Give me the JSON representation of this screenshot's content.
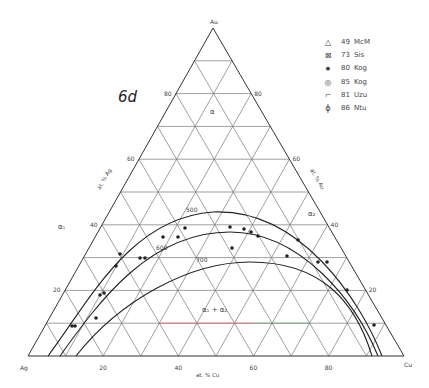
{
  "figure": {
    "label": "6d",
    "vertices": {
      "top": "Au",
      "left": "Ag",
      "right": "Cu"
    },
    "axis_titles": {
      "left": "at. % Ag",
      "right": "at. % Au",
      "bottom": "at. % Cu"
    },
    "ticks": {
      "left": [
        "20",
        "40",
        "60",
        "80"
      ],
      "right": [
        "80",
        "60",
        "40",
        "20"
      ],
      "bottom": [
        "20",
        "40",
        "60",
        "80"
      ]
    },
    "phase_labels": {
      "alpha": "α",
      "alpha1": "α₁",
      "alpha2": "α₂",
      "two_phase": "α₁ + α₂"
    },
    "isotherms": [
      "500",
      "600",
      "700"
    ],
    "colors": {
      "grid": "#777777",
      "frame": "#333333",
      "curve": "#222222",
      "accent_red": "#e06060",
      "accent_green": "#4a9a4a"
    }
  },
  "legend": [
    {
      "symbol": "△",
      "num": "49",
      "ref": "McM"
    },
    {
      "symbol": "⊠",
      "num": "73",
      "ref": "Sis"
    },
    {
      "symbol": "●",
      "num": "80",
      "ref": "Kog"
    },
    {
      "symbol": "◎",
      "num": "85",
      "ref": "Kog"
    },
    {
      "symbol": "⌐",
      "num": "81",
      "ref": "Uzu"
    },
    {
      "symbol": "ϕ",
      "num": "86",
      "ref": "Ntu"
    }
  ]
}
